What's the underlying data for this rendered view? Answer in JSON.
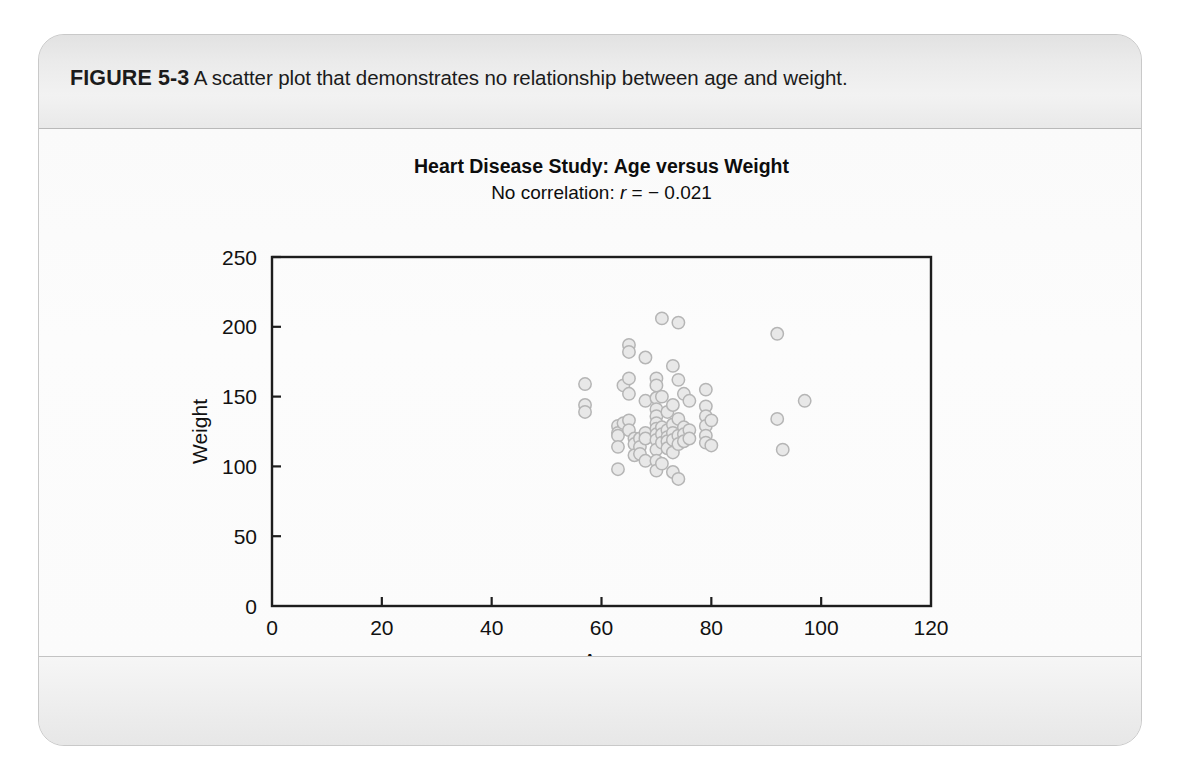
{
  "figure": {
    "label": "FIGURE 5-3",
    "caption": " A scatter plot that demonstrates no relationship between age and weight."
  },
  "chart_data": {
    "type": "scatter",
    "title": "Heart Disease Study: Age versus Weight",
    "subtitle_prefix": "No correlation: ",
    "subtitle_symbol": "r",
    "subtitle_value": " = − 0.021",
    "correlation_r": -0.021,
    "xlabel": "Age",
    "ylabel": "Weight",
    "xlim": [
      0,
      120
    ],
    "ylim": [
      0,
      250
    ],
    "xticks": [
      0,
      20,
      40,
      60,
      80,
      100,
      120
    ],
    "yticks": [
      0,
      50,
      100,
      150,
      200,
      250
    ],
    "grid": false,
    "legend": null,
    "marker": {
      "shape": "circle",
      "fill": "#e8e8e8",
      "stroke": "#b5b5b5",
      "radius": 6.2
    },
    "points": [
      [
        57,
        159
      ],
      [
        57,
        144
      ],
      [
        57,
        139
      ],
      [
        63,
        129
      ],
      [
        63,
        124
      ],
      [
        63,
        122
      ],
      [
        63,
        114
      ],
      [
        63,
        98
      ],
      [
        64,
        158
      ],
      [
        64,
        131
      ],
      [
        65,
        187
      ],
      [
        65,
        182
      ],
      [
        65,
        163
      ],
      [
        65,
        152
      ],
      [
        65,
        133
      ],
      [
        65,
        126
      ],
      [
        66,
        120
      ],
      [
        66,
        116
      ],
      [
        66,
        108
      ],
      [
        67,
        120
      ],
      [
        67,
        114
      ],
      [
        67,
        109
      ],
      [
        68,
        178
      ],
      [
        68,
        147
      ],
      [
        68,
        124
      ],
      [
        68,
        120
      ],
      [
        68,
        104
      ],
      [
        70,
        163
      ],
      [
        70,
        158
      ],
      [
        70,
        149
      ],
      [
        70,
        141
      ],
      [
        70,
        136
      ],
      [
        70,
        131
      ],
      [
        70,
        127
      ],
      [
        70,
        123
      ],
      [
        70,
        119
      ],
      [
        70,
        112
      ],
      [
        70,
        104
      ],
      [
        70,
        97
      ],
      [
        71,
        206
      ],
      [
        71,
        150
      ],
      [
        71,
        128
      ],
      [
        71,
        123
      ],
      [
        71,
        117
      ],
      [
        71,
        102
      ],
      [
        72,
        139
      ],
      [
        72,
        126
      ],
      [
        72,
        121
      ],
      [
        72,
        118
      ],
      [
        72,
        113
      ],
      [
        73,
        172
      ],
      [
        73,
        144
      ],
      [
        73,
        130
      ],
      [
        73,
        124
      ],
      [
        73,
        119
      ],
      [
        73,
        110
      ],
      [
        73,
        96
      ],
      [
        74,
        203
      ],
      [
        74,
        162
      ],
      [
        74,
        134
      ],
      [
        74,
        122
      ],
      [
        74,
        116
      ],
      [
        74,
        91
      ],
      [
        75,
        152
      ],
      [
        75,
        128
      ],
      [
        75,
        123
      ],
      [
        75,
        118
      ],
      [
        76,
        147
      ],
      [
        76,
        126
      ],
      [
        76,
        120
      ],
      [
        79,
        155
      ],
      [
        79,
        143
      ],
      [
        79,
        136
      ],
      [
        79,
        129
      ],
      [
        79,
        122
      ],
      [
        79,
        117
      ],
      [
        80,
        133
      ],
      [
        80,
        115
      ],
      [
        92,
        195
      ],
      [
        92,
        134
      ],
      [
        93,
        112
      ],
      [
        97,
        147
      ]
    ]
  }
}
